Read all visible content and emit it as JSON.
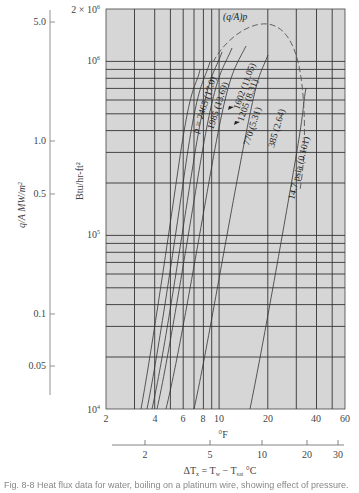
{
  "chart_data": {
    "type": "line",
    "title": "",
    "xlabel_primary": "°F",
    "xlabel_secondary": "ΔT_x = T_w − T_sat °C",
    "ylabel_primary": "Btu/hr-ft²",
    "ylabel_secondary": "q/A MW/m²",
    "x_scale": "log",
    "y_scale": "log",
    "xlim": [
      2,
      60
    ],
    "ylim": [
      10000,
      2000000
    ],
    "grid": true,
    "x_ticks": [
      "2",
      "4",
      "6",
      "8",
      "10",
      "20",
      "40",
      "60"
    ],
    "y_ticks": [
      "10⁴",
      "10⁵",
      "10⁶",
      "2 × 10⁶"
    ],
    "secondary_x_ticks": [
      "2",
      "5",
      "10",
      "20",
      "30"
    ],
    "secondary_y_ticks": [
      "5.0",
      "1.0",
      "0.5",
      "0.1",
      "0.05"
    ],
    "envelope_label": "(q/A)p",
    "series": [
      {
        "name": "p = 2465 (17.0)",
        "x": [
          3.3,
          5.0,
          7.5,
          9.5
        ],
        "y": [
          10000,
          60000,
          400000,
          1150000
        ]
      },
      {
        "name": "1985 (13.69)",
        "x": [
          3.6,
          5.5,
          8.2,
          10.5
        ],
        "y": [
          10000,
          60000,
          400000,
          1300000
        ]
      },
      {
        "name": "1602 (11.05)",
        "x": [
          3.9,
          6.0,
          9.5,
          12.5
        ],
        "y": [
          10000,
          60000,
          500000,
          1500000
        ]
      },
      {
        "name": "1205 (8.31)",
        "x": [
          4.2,
          6.5,
          10.5,
          14.0
        ],
        "y": [
          10000,
          60000,
          500000,
          1550000
        ]
      },
      {
        "name": "770 (5.31)",
        "x": [
          4.8,
          7.5,
          12.0,
          16.5
        ],
        "y": [
          10000,
          60000,
          500000,
          1550000
        ]
      },
      {
        "name": "385 (2.64)",
        "x": [
          7.2,
          10.5,
          16.0,
          22.0
        ],
        "y": [
          10000,
          60000,
          400000,
          1200000
        ]
      },
      {
        "name": "14.7 psia (0.101)",
        "x": [
          14.0,
          18.5,
          23.0,
          28.0
        ],
        "y": [
          10000,
          60000,
          250000,
          700000
        ]
      }
    ],
    "peak_envelope": {
      "name": "(q/A)p",
      "style": "dashed",
      "x": [
        9.0,
        12.0,
        16.0,
        21.0,
        26.0,
        29.0,
        28.0
      ],
      "y": [
        1000000,
        1600000,
        1850000,
        1750000,
        1100000,
        500000,
        250000
      ]
    }
  },
  "labels": {
    "y_top": "2 × 10",
    "y_top_exp": "6",
    "y_1e6": "10",
    "y_1e6_exp": "6",
    "y_1e5": "10",
    "y_1e5_exp": "5",
    "y_1e4": "10",
    "y_1e4_exp": "4",
    "btu_unit": "Btu/hr-ft²",
    "mw_unit": "q/A MW/m²",
    "deg_f": "°F",
    "delta_t": "ΔT",
    "delta_t_sub": "x",
    "delta_t_eq": " = T",
    "tw_sub": "w",
    "minus": " − T",
    "tsat_sub": "sat",
    "deg_c": " °C",
    "envelope": "(q/A)p",
    "curve_2465": "p = 2465 (17.0)",
    "curve_1985": "1985 (13.69)",
    "curve_1602": "1602 (11.05)",
    "curve_1205": "1205 (8.31)",
    "curve_770": "770 (5.31)",
    "curve_385": "385 (2.64)",
    "curve_147": "14.7 psia (0.101)"
  },
  "xticks_f": [
    {
      "label": "2",
      "x": 106
    },
    {
      "label": "4",
      "x": 155
    },
    {
      "label": "6",
      "x": 183
    },
    {
      "label": "8",
      "x": 203
    },
    {
      "label": "10",
      "x": 219
    },
    {
      "label": "20",
      "x": 268
    },
    {
      "label": "40",
      "x": 316
    },
    {
      "label": "60",
      "x": 345
    }
  ],
  "xticks_c": [
    {
      "label": "2",
      "x": 145
    },
    {
      "label": "5",
      "x": 210
    },
    {
      "label": "10",
      "x": 262
    },
    {
      "label": "20",
      "x": 307
    },
    {
      "label": "30",
      "x": 338
    }
  ],
  "yticks_mw": [
    {
      "label": "5.0",
      "y": 22
    },
    {
      "label": "1.0",
      "y": 141
    },
    {
      "label": "0.5",
      "y": 194
    },
    {
      "label": "0.1",
      "y": 314
    },
    {
      "label": "0.05",
      "y": 366
    }
  ],
  "caption": "Fig. 8-8  Heat flux data for water, boiling on a platinum wire, showing effect of pressure."
}
